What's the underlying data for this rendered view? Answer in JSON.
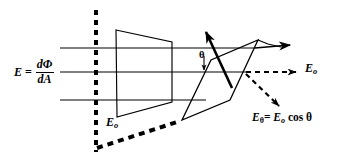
{
  "figure": {
    "background_color": "#ffffff",
    "stroke_color": "#000000",
    "labels": {
      "flux_equation": {
        "lhs": "E",
        "equals": "=",
        "numerator": "dΦ",
        "denominator": "dA"
      },
      "eo_surface": {
        "base": "E",
        "subscript": "o"
      },
      "eo_axis": {
        "base": "E",
        "subscript": "o"
      },
      "e_theta": {
        "base": "E",
        "subscript": "θ",
        "equals": "=",
        "rhs_base": "E",
        "rhs_subscript": "o",
        "rhs_factor": "cos θ"
      },
      "theta_angle": "θ"
    },
    "elements": {
      "flux_lines": [
        {
          "name": "flux-line-top",
          "y": 48
        },
        {
          "name": "flux-line-middle",
          "y": 72
        },
        {
          "name": "flux-line-bottom",
          "y": 100
        }
      ],
      "dashed_vertical_line": {
        "x": 96,
        "y1": 10,
        "y2": 152
      },
      "front_surface": "quadrilateral normal to flux",
      "tilted_surface": "parallelogram inclined at angle theta",
      "normal_arrow": "surface normal vector",
      "eo_arrow": "dashed horizontal flux vector",
      "etheta_arrow": "dashed projected flux vector",
      "flux_arrow_right": "solid flux direction arrow"
    }
  }
}
